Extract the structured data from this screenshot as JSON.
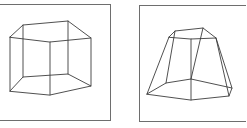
{
  "figure": {
    "panels": [
      {
        "id": "left",
        "label": "pentagonal-prism-wireframe",
        "frame": {
          "x": -2,
          "y": 4,
          "w": 112,
          "h": 116
        },
        "top": [
          [
            10,
            37
          ],
          [
            23,
            25
          ],
          [
            68,
            21
          ],
          [
            91,
            38
          ],
          [
            50,
            42
          ]
        ],
        "bottom": [
          [
            10,
            91
          ],
          [
            23,
            77
          ],
          [
            68,
            74
          ],
          [
            91,
            86
          ],
          [
            50,
            95
          ]
        ]
      },
      {
        "id": "right",
        "label": "pentagonal-frustum-wireframe",
        "frame": {
          "x": 139,
          "y": 5,
          "w": 110,
          "h": 116
        },
        "top": [
          [
            169,
            37
          ],
          [
            175,
            31
          ],
          [
            203,
            28
          ],
          [
            216,
            38
          ],
          [
            191,
            39
          ]
        ],
        "bottom": [
          [
            147,
            94
          ],
          [
            166,
            83
          ],
          [
            191,
            79
          ],
          [
            232,
            88
          ],
          [
            191,
            100
          ]
        ],
        "bottom_extra": [
          [
            229,
            96
          ]
        ]
      }
    ],
    "colors": {
      "frame": "#6e6e6e",
      "edge": "#3c3c3c",
      "background": "#ffffff"
    }
  }
}
